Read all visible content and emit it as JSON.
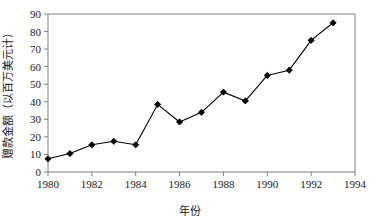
{
  "chart_data": {
    "type": "line",
    "title": "",
    "subtitle": "",
    "xlabel": "年份",
    "ylabel": "赠款金额（以百万美元计）",
    "x": [
      1980,
      1981,
      1982,
      1983,
      1984,
      1985,
      1986,
      1987,
      1988,
      1989,
      1990,
      1991,
      1992,
      1993
    ],
    "values": [
      7.5,
      10.5,
      15.5,
      17.5,
      15.5,
      38.5,
      28.5,
      34,
      45.5,
      40.5,
      55,
      58,
      75,
      85
    ],
    "series": [
      {
        "name": "赠款金额",
        "values": [
          7.5,
          10.5,
          15.5,
          17.5,
          15.5,
          38.5,
          28.5,
          34,
          45.5,
          40.5,
          55,
          58,
          75,
          85
        ]
      }
    ],
    "xlim": [
      1980,
      1994
    ],
    "ylim": [
      0,
      90
    ],
    "xticks": [
      1980,
      1982,
      1984,
      1986,
      1988,
      1990,
      1992,
      1994
    ],
    "xtick_labels": [
      "1980",
      "1982",
      "1984",
      "1986",
      "1988",
      "1990",
      "1992",
      "1994"
    ],
    "yticks": [
      0,
      10,
      20,
      30,
      40,
      50,
      60,
      70,
      80,
      90
    ],
    "ytick_labels": [
      "0",
      "10",
      "20",
      "30",
      "40",
      "50",
      "60",
      "70",
      "80",
      "90"
    ],
    "grid": false,
    "legend": "none",
    "marker": "diamond",
    "line_color": "#000000",
    "marker_color": "#000000",
    "axis_color": "#808080",
    "background_color": "#ffffff"
  }
}
